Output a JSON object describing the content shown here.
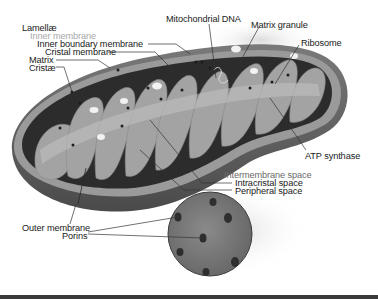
{
  "diagram": {
    "colors": {
      "background": "#ffffff",
      "outer_shell": "#5e5e5e",
      "shell_rim": "#9a9a9a",
      "interior_dark": "#2c2c2c",
      "cristae": "#a3a3a3",
      "cristae_light": "#c2c2c2",
      "granule": "#f2f2f2",
      "porin": "#2e2e2e",
      "leader_line": "#333333"
    },
    "labels": {
      "lamellae": "Lamellæ",
      "inner_membrane": "Inner membrane",
      "inner_boundary_membrane": "Inner boundary membrane",
      "cristal_membrane": "Cristal membrane",
      "matrix": "Matrix",
      "cristae": "Cristæ",
      "mitochondrial_dna": "Mitochondrial DNA",
      "matrix_granule": "Matrix granule",
      "ribosome": "Ribosome",
      "atp_synthase": "ATP synthase",
      "intermembrane_space": "Intermembrane space",
      "intracristal_space": "Intracristal space",
      "peripheral_space": "Peripheral space",
      "outer_membrane": "Outer membrane",
      "porins": "Porins"
    }
  }
}
